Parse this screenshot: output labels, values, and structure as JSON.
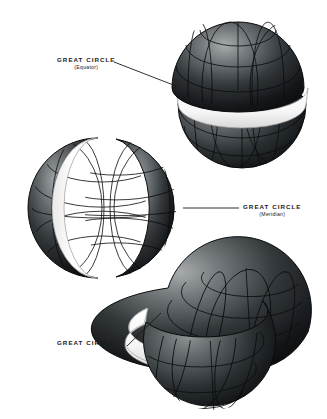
{
  "figure": {
    "background_color": "#ffffff",
    "ink_color": "#1a1a1a",
    "cut_face_color": "#ffffff",
    "sphere_dark": "#16181a",
    "sphere_mid": "#4a4f52",
    "sphere_light": "#b9bcbd",
    "graticule_color": "#0d0f10"
  },
  "labels": [
    {
      "id": "equator",
      "main": "GREAT CIRCLE",
      "sub": "(Equator)",
      "leader": {
        "x1": 114,
        "y1": 62,
        "x2": 176,
        "y2": 86
      }
    },
    {
      "id": "meridian",
      "main": "GREAT CIRCLE",
      "sub": "(Meridian)",
      "leader": {
        "x1": 183,
        "y1": 208,
        "x2": 239,
        "y2": 208
      }
    },
    {
      "id": "oblique",
      "main": "GREAT CIRCLE",
      "sub": "",
      "leader": {
        "x1": 127,
        "y1": 346,
        "x2": 161,
        "y2": 313
      }
    }
  ],
  "spheres": [
    {
      "id": "equatorial-sphere",
      "name": "sphere-cut-by-equator",
      "center": {
        "x": 238,
        "y": 78
      },
      "radius": 66,
      "cut": "equator",
      "cut_orientation": "horizontal",
      "description": "Sphere separated into two hemispheres along the equator, the white band is the exposed great-circle cut face"
    },
    {
      "id": "meridian-sphere",
      "name": "sphere-cut-by-meridian",
      "center": {
        "x": 102,
        "y": 208
      },
      "radius": 70,
      "cut": "meridian",
      "cut_orientation": "vertical",
      "description": "Sphere separated along a meridian, white crescent band is the exposed great-circle cut face"
    },
    {
      "id": "oblique-sphere",
      "name": "sphere-cut-by-oblique-great-circle",
      "center": {
        "x": 238,
        "y": 340
      },
      "radius": 70,
      "cut": "oblique",
      "cut_orientation": "tilted",
      "description": "Sphere separated along an inclined great circle, lower segment displaced down-left exposing the white cut face"
    }
  ]
}
